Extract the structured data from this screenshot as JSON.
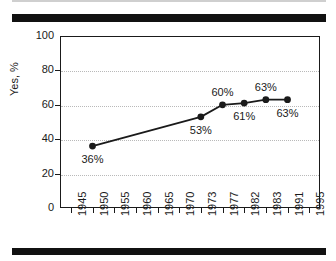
{
  "figure": {
    "background_color": "#ffffff",
    "frame_color": "#1a1a1a",
    "rule_color": "#111111",
    "series_color": "#1a1a1a",
    "gridline_color": "#b9b9b9"
  },
  "chart_data": {
    "type": "line",
    "title": "",
    "subtitle": "",
    "xlabel": "",
    "ylabel": "Yes, %",
    "x": [
      "1950",
      "1973",
      "1977",
      "1982",
      "1983",
      "1991"
    ],
    "values": [
      36,
      53,
      60,
      61,
      63,
      63
    ],
    "point_labels": [
      "36%",
      "53%",
      "60%",
      "61%",
      "63%",
      "63%"
    ],
    "series": [
      {
        "name": "Yes, %",
        "values": [
          36,
          53,
          60,
          61,
          63,
          63
        ]
      }
    ],
    "ylim": [
      0,
      100
    ],
    "y_ticks": [
      0,
      20,
      40,
      60,
      80,
      100
    ],
    "y_tick_labels": [
      "0",
      "20",
      "40",
      "60",
      "80",
      "100"
    ],
    "x_tick_labels": [
      "1945",
      "1950",
      "1955",
      "1960",
      "1965",
      "1970",
      "1973",
      "1977",
      "1982",
      "1983",
      "1991",
      "1995"
    ],
    "grid": "horizontal-dotted",
    "grid_values": [
      20,
      40,
      60,
      80
    ],
    "legend": "none",
    "legend_position": "none",
    "marker": "filled-circle",
    "annotations": []
  }
}
